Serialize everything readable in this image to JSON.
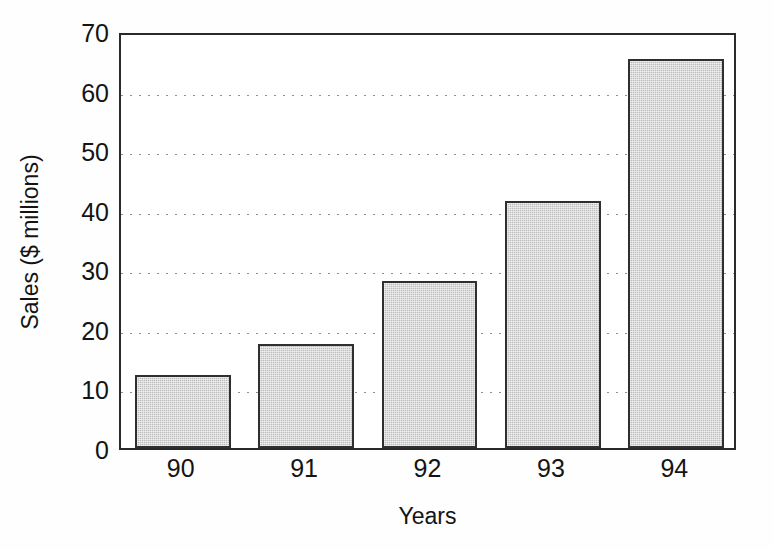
{
  "chart_data": {
    "type": "bar",
    "title": "",
    "subtitle": "",
    "xlabel": "Years",
    "ylabel": "Sales ($ millions)",
    "categories": [
      "90",
      "91",
      "92",
      "93",
      "94"
    ],
    "values": [
      12.3,
      17.4,
      28.0,
      41.5,
      65.3
    ],
    "series": [
      {
        "name": "Sales",
        "values": [
          12.3,
          17.4,
          28.0,
          41.5,
          65.3
        ]
      }
    ],
    "ylim": [
      0,
      70
    ],
    "ytick_labels": [
      "0",
      "10",
      "20",
      "30",
      "40",
      "50",
      "60",
      "70"
    ],
    "ytick_values": [
      0,
      10,
      20,
      30,
      40,
      50,
      60,
      70
    ],
    "xtick_labels": [
      "90",
      "91",
      "92",
      "93",
      "94"
    ],
    "grid": "horizontal-dotted",
    "legend": "none",
    "annotations": [],
    "colors": {
      "bar_fill": "#bdbdbd",
      "bar_border": "#2f2f2f",
      "axis": "#2a2a2a",
      "gridline": "#8e8e96",
      "text": "#141414",
      "background": "#fefefe"
    }
  }
}
